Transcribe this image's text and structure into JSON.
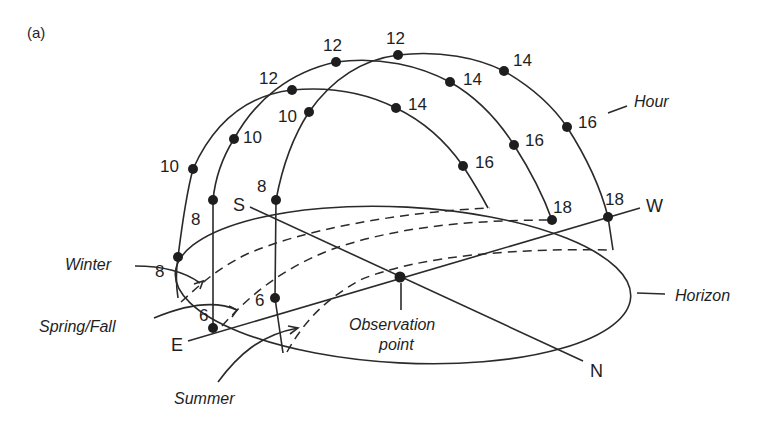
{
  "figure": {
    "panel_label": "(a)",
    "labels": {
      "hour": "Hour",
      "horizon": "Horizon",
      "winter": "Winter",
      "spring_fall": "Spring/Fall",
      "summer": "Summer",
      "observation_line1": "Observation",
      "observation_line2": "point"
    },
    "directions": {
      "east": "E",
      "west": "W",
      "south": "S",
      "north": "N"
    },
    "paths": {
      "winter": {
        "name": "Winter",
        "hours": [
          {
            "label": "8",
            "x": 178,
            "y": 257
          },
          {
            "label": "10",
            "x": 193,
            "y": 169
          },
          {
            "label": "12",
            "x": 292,
            "y": 90
          },
          {
            "label": "14",
            "x": 396,
            "y": 108
          },
          {
            "label": "16",
            "x": 463,
            "y": 166
          }
        ]
      },
      "spring_fall": {
        "name": "Spring/Fall",
        "hours": [
          {
            "label": "6",
            "x": 213,
            "y": 328
          },
          {
            "label": "8",
            "x": 213,
            "y": 200
          },
          {
            "label": "10",
            "x": 234,
            "y": 139
          },
          {
            "label": "12",
            "x": 336,
            "y": 62
          },
          {
            "label": "14",
            "x": 450,
            "y": 82
          },
          {
            "label": "16",
            "x": 514,
            "y": 145
          },
          {
            "label": "18",
            "x": 552,
            "y": 220
          }
        ]
      },
      "summer": {
        "name": "Summer",
        "hours": [
          {
            "label": "6",
            "x": 275,
            "y": 298
          },
          {
            "label": "8",
            "x": 276,
            "y": 200
          },
          {
            "label": "10",
            "x": 309,
            "y": 112
          },
          {
            "label": "12",
            "x": 398,
            "y": 55
          },
          {
            "label": "14",
            "x": 504,
            "y": 71
          },
          {
            "label": "16",
            "x": 567,
            "y": 127
          },
          {
            "label": "18",
            "x": 608,
            "y": 217
          }
        ]
      }
    }
  }
}
